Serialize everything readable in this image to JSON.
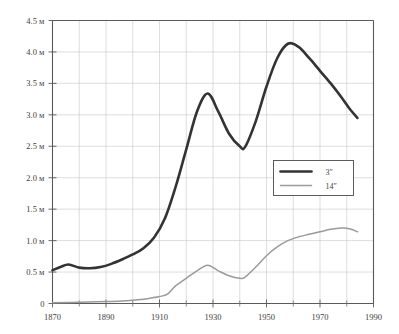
{
  "chart_data": {
    "type": "line",
    "title": "",
    "xlabel": "",
    "ylabel": "",
    "xlim": [
      1870,
      1990
    ],
    "ylim": [
      0,
      4.5
    ],
    "grid": true,
    "legend_position": "center-right",
    "y_unit": "м",
    "y_ticks": [
      0,
      0.5,
      1.0,
      1.5,
      2.0,
      2.5,
      3.0,
      3.5,
      4.0,
      4.5
    ],
    "y_tick_labels": [
      "0",
      "0.5 м",
      "1.0 м",
      "1.5 м",
      "2.0 м",
      "2.5 м",
      "3.0 м",
      "3.5 м",
      "4.0 м",
      "4.5 м"
    ],
    "x_ticks": [
      1870,
      1890,
      1910,
      1930,
      1950,
      1970,
      1990
    ],
    "x_tick_labels": [
      "1870",
      "1890",
      "1910",
      "1930",
      "1950",
      "1970",
      "1990"
    ],
    "x_minor_ticks": [
      1880,
      1900,
      1920,
      1940,
      1960,
      1980
    ],
    "series": [
      {
        "name": "3ʺ",
        "color": "#333333",
        "width": 2.6,
        "x": [
          1870,
          1873,
          1876,
          1880,
          1884,
          1888,
          1892,
          1896,
          1900,
          1904,
          1908,
          1912,
          1916,
          1920,
          1924,
          1928,
          1932,
          1936,
          1940,
          1942,
          1946,
          1950,
          1954,
          1958,
          1962,
          1966,
          1970,
          1974,
          1978,
          1981,
          1984
        ],
        "values": [
          0.53,
          0.58,
          0.62,
          0.57,
          0.56,
          0.58,
          0.63,
          0.7,
          0.78,
          0.88,
          1.05,
          1.35,
          1.85,
          2.45,
          3.05,
          3.34,
          3.05,
          2.7,
          2.5,
          2.49,
          2.9,
          3.45,
          3.9,
          4.13,
          4.08,
          3.9,
          3.7,
          3.5,
          3.28,
          3.1,
          2.95
        ]
      },
      {
        "name": "14ʺ",
        "color": "#9a9a9a",
        "width": 1.5,
        "x": [
          1870,
          1880,
          1890,
          1896,
          1902,
          1906,
          1910,
          1913,
          1916,
          1920,
          1924,
          1928,
          1932,
          1936,
          1940,
          1942,
          1946,
          1950,
          1954,
          1958,
          1962,
          1966,
          1970,
          1974,
          1978,
          1981,
          1984
        ],
        "values": [
          0.01,
          0.02,
          0.03,
          0.04,
          0.06,
          0.08,
          0.11,
          0.15,
          0.28,
          0.4,
          0.52,
          0.61,
          0.52,
          0.44,
          0.4,
          0.42,
          0.58,
          0.76,
          0.9,
          1.0,
          1.06,
          1.1,
          1.14,
          1.18,
          1.2,
          1.19,
          1.14
        ]
      }
    ],
    "legend_entries": [
      {
        "label": "3ʺ",
        "color": "#333333",
        "width": 2.6
      },
      {
        "label": "14ʺ",
        "color": "#9a9a9a",
        "width": 1.5
      }
    ]
  }
}
